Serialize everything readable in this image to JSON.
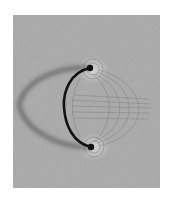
{
  "image": {
    "subject": "iron-filings-magnetic-field-around-wire-loop",
    "alt": "Iron filings aligned along magnetic field lines around a semicircular current-carrying wire",
    "colors": {
      "page_background": "#ffffff",
      "filings_background": "#a9a9a9",
      "filings_dark": "#6e6e6e",
      "halo": "#cfcfcf",
      "wire": "#111111",
      "shadow": "#555555"
    },
    "frame": {
      "x": 13,
      "y": 15,
      "width": 147,
      "height": 173
    },
    "wire": {
      "top_end": [
        90,
        68
      ],
      "bottom_end": [
        91,
        147
      ],
      "leftmost_x": 64
    },
    "shadow": {
      "leftmost": [
        18,
        105
      ]
    }
  }
}
